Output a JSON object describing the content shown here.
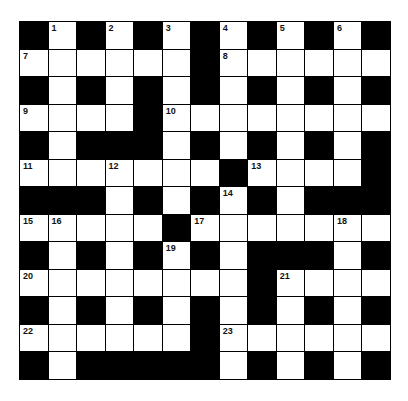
{
  "puzzle": {
    "rows": 13,
    "cols": 13,
    "layout": [
      "#.#.#.#.#.#.#",
      "......#......",
      "#.#.#.#.#.#.#",
      "....#........",
      "#.###.#.#.#.#",
      ".......#....#",
      "###.#.#.#.###",
      ".....#.......",
      "#.#.#.#.###.#",
      "........#....",
      "#.#.#.#.#.#.#",
      "......#......",
      "#.#####.#.#.#"
    ],
    "numbers": [
      {
        "n": "1",
        "r": 0,
        "c": 1
      },
      {
        "n": "2",
        "r": 0,
        "c": 3
      },
      {
        "n": "3",
        "r": 0,
        "c": 5
      },
      {
        "n": "4",
        "r": 0,
        "c": 7
      },
      {
        "n": "5",
        "r": 0,
        "c": 9
      },
      {
        "n": "6",
        "r": 0,
        "c": 11
      },
      {
        "n": "7",
        "r": 1,
        "c": 0
      },
      {
        "n": "8",
        "r": 1,
        "c": 7
      },
      {
        "n": "9",
        "r": 3,
        "c": 0
      },
      {
        "n": "10",
        "r": 3,
        "c": 5
      },
      {
        "n": "11",
        "r": 5,
        "c": 0
      },
      {
        "n": "12",
        "r": 5,
        "c": 3
      },
      {
        "n": "13",
        "r": 5,
        "c": 8
      },
      {
        "n": "14",
        "r": 6,
        "c": 7
      },
      {
        "n": "15",
        "r": 7,
        "c": 0
      },
      {
        "n": "16",
        "r": 7,
        "c": 1
      },
      {
        "n": "17",
        "r": 7,
        "c": 6
      },
      {
        "n": "18",
        "r": 7,
        "c": 11
      },
      {
        "n": "19",
        "r": 8,
        "c": 5
      },
      {
        "n": "20",
        "r": 9,
        "c": 0
      },
      {
        "n": "21",
        "r": 9,
        "c": 9
      },
      {
        "n": "22",
        "r": 11,
        "c": 0
      },
      {
        "n": "23",
        "r": 11,
        "c": 7
      }
    ]
  }
}
